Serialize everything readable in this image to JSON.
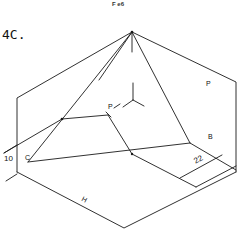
{
  "header": {
    "caption": "F e6"
  },
  "figure": {
    "title": "4C.",
    "labels": {
      "plane_right": "P",
      "point_p": "P",
      "point_b": "B",
      "point_c": "C",
      "dim_left": "10",
      "dim_right": "22",
      "plane_bottom": "H"
    }
  },
  "colors": {
    "line": "#1a1a1a",
    "background": "#ffffff"
  }
}
